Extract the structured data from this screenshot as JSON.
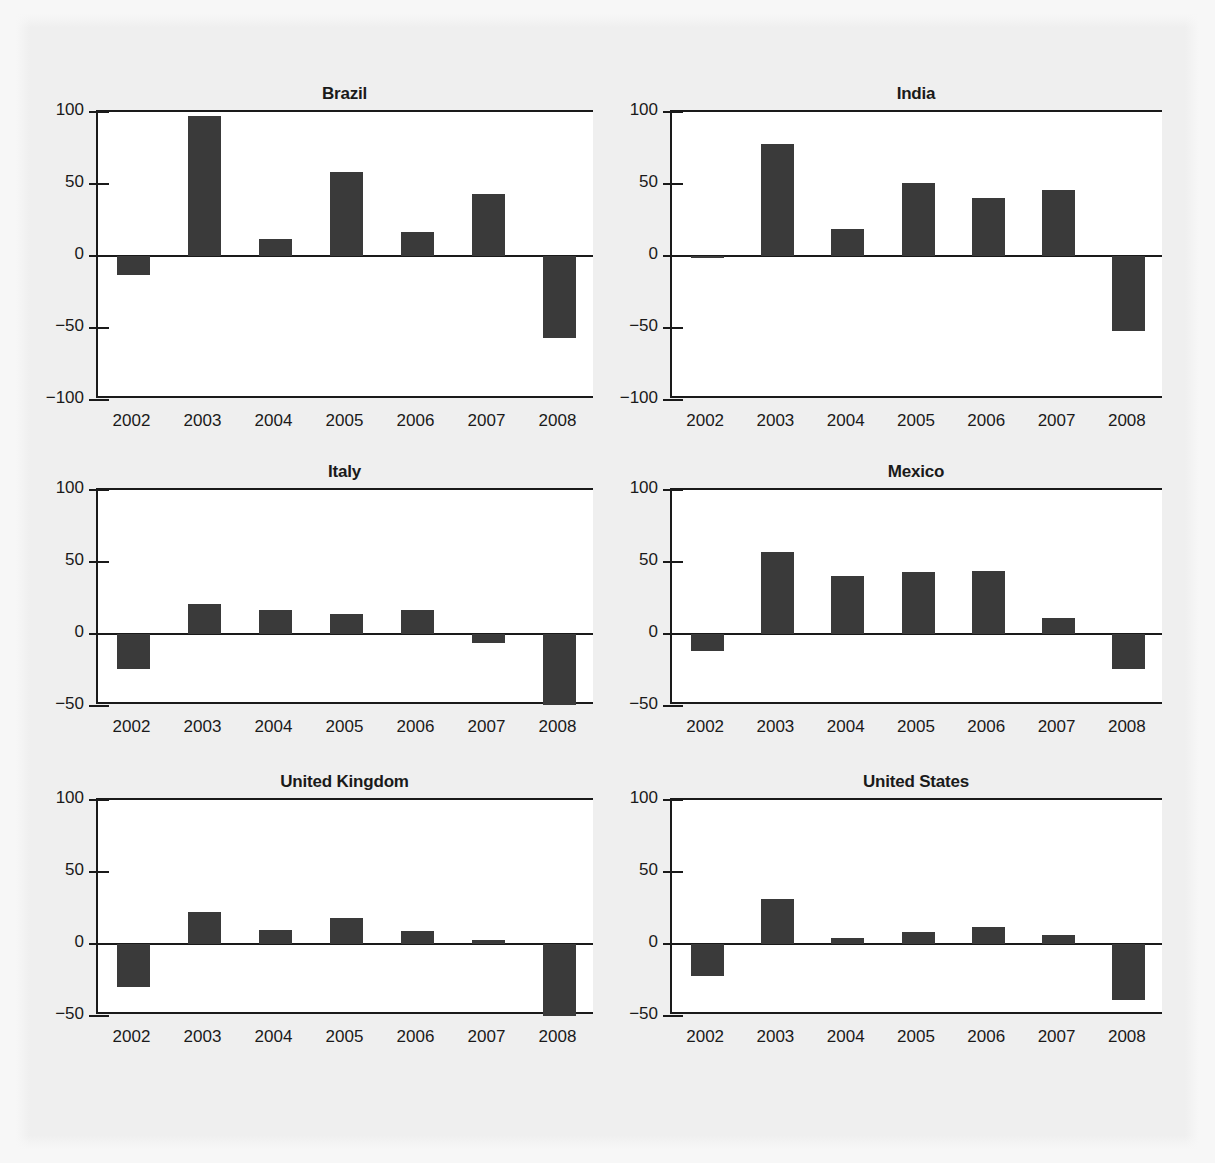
{
  "figure": {
    "background_color": "#efefef",
    "plot_background_color": "#ffffff",
    "bar_color": "#3a3a3a",
    "axis_color": "#1a1a1a"
  },
  "chart_data": [
    {
      "type": "bar",
      "title": "Brazil",
      "xlabel": "",
      "ylabel": "",
      "categories": [
        "2002",
        "2003",
        "2004",
        "2005",
        "2006",
        "2007",
        "2008"
      ],
      "values": [
        -13,
        97,
        12,
        58,
        17,
        43,
        -57
      ],
      "ylim": [
        -100,
        100
      ],
      "yticks": [
        -100,
        -50,
        0,
        50,
        100
      ],
      "ytick_labels": [
        "−100",
        "−50",
        "0",
        "50",
        "100"
      ],
      "grid": false,
      "legend": "none"
    },
    {
      "type": "bar",
      "title": "India",
      "xlabel": "",
      "ylabel": "",
      "categories": [
        "2002",
        "2003",
        "2004",
        "2005",
        "2006",
        "2007",
        "2008"
      ],
      "values": [
        -1,
        78,
        19,
        51,
        40,
        46,
        -52
      ],
      "ylim": [
        -100,
        100
      ],
      "yticks": [
        -100,
        -50,
        0,
        50,
        100
      ],
      "ytick_labels": [
        "−100",
        "−50",
        "0",
        "50",
        "100"
      ],
      "grid": false,
      "legend": "none"
    },
    {
      "type": "bar",
      "title": "Italy",
      "xlabel": "",
      "ylabel": "",
      "categories": [
        "2002",
        "2003",
        "2004",
        "2005",
        "2006",
        "2007",
        "2008"
      ],
      "values": [
        -24,
        21,
        17,
        14,
        17,
        -6,
        -49
      ],
      "ylim": [
        -50,
        100
      ],
      "yticks": [
        -50,
        0,
        50,
        100
      ],
      "ytick_labels": [
        "−50",
        "0",
        "50",
        "100"
      ],
      "grid": false,
      "legend": "none"
    },
    {
      "type": "bar",
      "title": "Mexico",
      "xlabel": "",
      "ylabel": "",
      "categories": [
        "2002",
        "2003",
        "2004",
        "2005",
        "2006",
        "2007",
        "2008"
      ],
      "values": [
        -12,
        57,
        40,
        43,
        44,
        11,
        -24
      ],
      "ylim": [
        -50,
        100
      ],
      "yticks": [
        -50,
        0,
        50,
        100
      ],
      "ytick_labels": [
        "−50",
        "0",
        "50",
        "100"
      ],
      "grid": false,
      "legend": "none"
    },
    {
      "type": "bar",
      "title": "United Kingdom",
      "xlabel": "",
      "ylabel": "",
      "categories": [
        "2002",
        "2003",
        "2004",
        "2005",
        "2006",
        "2007",
        "2008"
      ],
      "values": [
        -30,
        22,
        10,
        18,
        9,
        3,
        -50
      ],
      "ylim": [
        -50,
        100
      ],
      "yticks": [
        -50,
        0,
        50,
        100
      ],
      "ytick_labels": [
        "−50",
        "0",
        "50",
        "100"
      ],
      "grid": false,
      "legend": "none"
    },
    {
      "type": "bar",
      "title": "United States",
      "xlabel": "",
      "ylabel": "",
      "categories": [
        "2002",
        "2003",
        "2004",
        "2005",
        "2006",
        "2007",
        "2008"
      ],
      "values": [
        -22,
        31,
        4,
        8,
        12,
        6,
        -39
      ],
      "ylim": [
        -50,
        100
      ],
      "yticks": [
        -50,
        0,
        50,
        100
      ],
      "ytick_labels": [
        "−50",
        "0",
        "50",
        "100"
      ],
      "grid": false,
      "legend": "none"
    }
  ],
  "layout": {
    "rows": 3,
    "cols": 2,
    "panels": [
      {
        "chart_index": 0,
        "left": 96,
        "top": 110,
        "plot_width": 497,
        "plot_height": 288
      },
      {
        "chart_index": 1,
        "left": 670,
        "top": 110,
        "plot_width": 492,
        "plot_height": 288
      },
      {
        "chart_index": 2,
        "left": 96,
        "top": 488,
        "plot_width": 497,
        "plot_height": 216
      },
      {
        "chart_index": 3,
        "left": 670,
        "top": 488,
        "plot_width": 492,
        "plot_height": 216
      },
      {
        "chart_index": 4,
        "left": 96,
        "top": 798,
        "plot_width": 497,
        "plot_height": 216
      },
      {
        "chart_index": 5,
        "left": 670,
        "top": 798,
        "plot_width": 492,
        "plot_height": 216
      }
    ]
  }
}
